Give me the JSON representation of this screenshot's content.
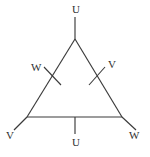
{
  "diagram": {
    "type": "triangle-terminal-graph",
    "shape": "equilateral-triangle",
    "stroke_color": "#3a3a3a",
    "label_color": "#2e2e2e",
    "background_color": "#ffffff",
    "vertices": [
      {
        "id": "apex",
        "x": 75,
        "y": 39
      },
      {
        "id": "bottom-left",
        "x": 27,
        "y": 117
      },
      {
        "id": "bottom-right",
        "x": 122,
        "y": 117
      }
    ],
    "terminals": [
      {
        "id": "top",
        "label": "U",
        "from_x": 75,
        "from_y": 39,
        "to_x": 75,
        "to_y": 17,
        "label_x": 72,
        "label_y": 5
      },
      {
        "id": "bottom-left",
        "label": "V",
        "from_x": 27,
        "from_y": 117,
        "to_x": 14,
        "to_y": 130,
        "label_x": 6,
        "label_y": 131
      },
      {
        "id": "bottom-right",
        "label": "W",
        "from_x": 122,
        "from_y": 117,
        "to_x": 136,
        "to_y": 130,
        "label_x": 129,
        "label_y": 131
      },
      {
        "id": "bottom-mid",
        "label": "U",
        "from_x": 75,
        "from_y": 117,
        "to_x": 75,
        "to_y": 134,
        "label_x": 72,
        "label_y": 138
      }
    ],
    "edge_ticks": [
      {
        "id": "left-edge-tick",
        "label": "W",
        "x1": 44,
        "y1": 67,
        "x2": 61,
        "y2": 85,
        "label_x": 31,
        "label_y": 62
      },
      {
        "id": "right-edge-tick",
        "label": "V",
        "x1": 105,
        "y1": 67,
        "x2": 89,
        "y2": 85,
        "label_x": 108,
        "label_y": 60
      }
    ],
    "edges": [
      {
        "id": "left-edge",
        "x1": 75,
        "y1": 39,
        "x2": 27,
        "y2": 117
      },
      {
        "id": "right-edge",
        "x1": 75,
        "y1": 39,
        "x2": 122,
        "y2": 117
      },
      {
        "id": "bottom-edge",
        "x1": 27,
        "y1": 117,
        "x2": 122,
        "y2": 117
      }
    ],
    "labels": {
      "top_terminal": "U",
      "bottom_mid_terminal": "U",
      "bottom_left_terminal": "V",
      "bottom_right_terminal": "W",
      "left_edge_tick": "W",
      "right_edge_tick": "V"
    }
  }
}
